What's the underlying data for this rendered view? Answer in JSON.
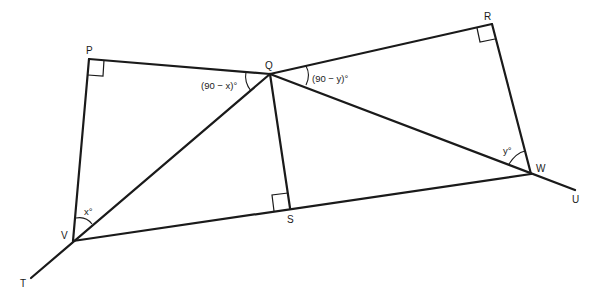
{
  "diagram": {
    "points": {
      "P": {
        "label": "P",
        "x": 89,
        "y": 59
      },
      "Q": {
        "label": "Q",
        "x": 270,
        "y": 74
      },
      "R": {
        "label": "R",
        "x": 492,
        "y": 24
      },
      "W": {
        "label": "W",
        "x": 531,
        "y": 174
      },
      "U": {
        "label": "U",
        "x": 575,
        "y": 190
      },
      "V": {
        "label": "V",
        "x": 73,
        "y": 241
      },
      "T": {
        "label": "T",
        "x": 31,
        "y": 278
      },
      "S": {
        "label": "S",
        "x": 290,
        "y": 208
      }
    },
    "segments": [
      [
        "P",
        "Q"
      ],
      [
        "P",
        "V"
      ],
      [
        "Q",
        "R"
      ],
      [
        "R",
        "W"
      ],
      [
        "Q",
        "W"
      ],
      [
        "Q",
        "S"
      ],
      [
        "V",
        "W"
      ],
      [
        "W",
        "U"
      ],
      [
        "Q",
        "T"
      ]
    ],
    "right_angles": [
      "P",
      "R",
      "S"
    ],
    "angles": {
      "PQV": {
        "label": "(90 − x)°"
      },
      "RQW": {
        "label": "(90 − y)°"
      },
      "PVQ": {
        "label": "x°"
      },
      "QWR": {
        "label": "y°"
      }
    }
  }
}
